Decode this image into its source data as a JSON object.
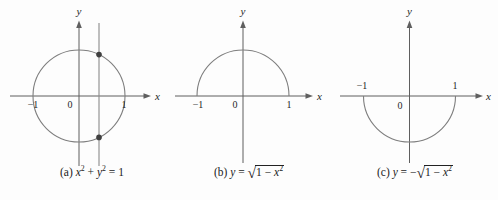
{
  "figure": {
    "background": "#fdfdfd",
    "colors": {
      "curve": "#7e7e7e",
      "axis": "#5f5f5f",
      "secant_line": "#8a8a8a",
      "dot": "#3f3f3f",
      "text": "#1f1f1f"
    },
    "panels": [
      {
        "caption_label": "(a)",
        "formula_text": "x² + y² = 1",
        "formula_html": "<var>x</var><sup>2</sup> + <var>y</var><sup>2</sup> = 1",
        "shape": "full-circle",
        "radius": 1,
        "x_axis_label": "x",
        "y_axis_label": "y",
        "tick_left": "−1",
        "tick_origin": "0",
        "tick_right": "1",
        "secant_line_x": 0.45,
        "intersection_dots": 2
      },
      {
        "caption_label": "(b)",
        "formula_text": "y = √(1 − x²)",
        "formula_html": "<var>y</var> = <span class=\"sqrt\">√</span><span class=\"radicand\">1 − <var>x</var><sup>2</sup></span>",
        "shape": "upper-semicircle",
        "radius": 1,
        "x_axis_label": "x",
        "y_axis_label": "y",
        "tick_left": "−1",
        "tick_origin": "0",
        "tick_right": "1"
      },
      {
        "caption_label": "(c)",
        "formula_text": "y = −√(1 − x²)",
        "formula_html": "<var>y</var> = −<span class=\"sqrt\">√</span><span class=\"radicand\">1 − <var>x</var><sup>2</sup></span>",
        "shape": "lower-semicircle",
        "radius": 1,
        "x_axis_label": "x",
        "y_axis_label": "y",
        "tick_left": "−1",
        "tick_origin": "0",
        "tick_right": "1"
      }
    ]
  }
}
